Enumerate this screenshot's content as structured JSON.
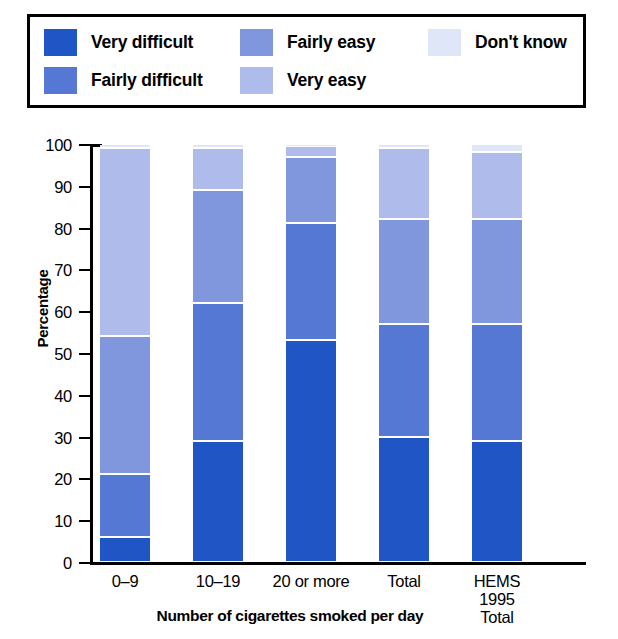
{
  "chart_data": {
    "type": "bar",
    "subtype": "stacked-bar-100",
    "title": "",
    "xlabel": "Number of cigarettes smoked per day",
    "ylabel": "Percentage",
    "ylim": [
      0,
      100
    ],
    "yticks": [
      0,
      10,
      20,
      30,
      40,
      50,
      60,
      70,
      80,
      90,
      100
    ],
    "grid": false,
    "legend_position": "top",
    "categories": [
      "0–9",
      "10–19",
      "20 or more",
      "Total",
      "HEMS\n1995\nTotal"
    ],
    "category_lines": [
      [
        "0–9"
      ],
      [
        "10–19"
      ],
      [
        "20 or more"
      ],
      [
        "Total"
      ],
      [
        "HEMS",
        "1995",
        "Total"
      ]
    ],
    "series": [
      {
        "name": "Very difficult",
        "color": "#1f55c4",
        "values": [
          6,
          29,
          53,
          30,
          29
        ]
      },
      {
        "name": "Fairly difficult",
        "color": "#5578d4",
        "values": [
          15,
          33,
          28,
          27,
          28
        ]
      },
      {
        "name": "Fairly easy",
        "color": "#8097de",
        "values": [
          33,
          27,
          16,
          25,
          25
        ]
      },
      {
        "name": "Very easy",
        "color": "#aebbeb",
        "values": [
          45,
          10,
          2.5,
          17,
          16
        ]
      },
      {
        "name": "Don't know",
        "color": "#dfe6f7",
        "values": [
          1,
          1,
          0.5,
          1,
          2
        ]
      }
    ],
    "cumulative_tops": [
      [
        6,
        21,
        54,
        99,
        100
      ],
      [
        29,
        62,
        89,
        99,
        100
      ],
      [
        53,
        81,
        97,
        99.5,
        100
      ],
      [
        30,
        57,
        82,
        99,
        100
      ],
      [
        29,
        57,
        82,
        98,
        100
      ]
    ]
  },
  "legend": {
    "items": [
      {
        "label": "Very difficult",
        "color": "#1f55c4",
        "icon": "legend-swatch-very-difficult"
      },
      {
        "label": "Fairly easy",
        "color": "#8097de",
        "icon": "legend-swatch-fairly-easy"
      },
      {
        "label": "Don't know",
        "color": "#dfe6f7",
        "icon": "legend-swatch-dont-know"
      },
      {
        "label": "Fairly difficult",
        "color": "#5578d4",
        "icon": "legend-swatch-fairly-difficult"
      },
      {
        "label": "Very easy",
        "color": "#aebbeb",
        "icon": "legend-swatch-very-easy"
      }
    ]
  },
  "axes": {
    "y_title": "Percentage",
    "x_title": "Number of cigarettes smoked per day",
    "y_tick_labels": [
      "100",
      "90",
      "80",
      "70",
      "60",
      "50",
      "40",
      "30",
      "20",
      "10",
      "0"
    ]
  }
}
